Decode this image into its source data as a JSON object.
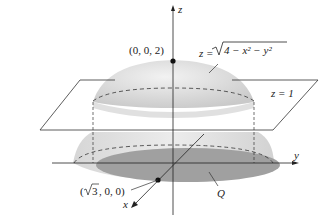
{
  "diagram": {
    "type": "3d-surface-figure",
    "axes": {
      "z": "z",
      "y": "y",
      "x": "x"
    },
    "labels": {
      "top_point": "(0, 0, 2)",
      "surface_eq_prefix": "z = ",
      "surface_eq_radicand": "4 − x² − y²",
      "plane_eq": "z = 1",
      "x_point_open": "(",
      "x_point_sqrt": "3",
      "x_point_rest": ", 0, 0)",
      "region": "Q"
    },
    "colors": {
      "hemisphere_light": "#e8e8e8",
      "hemisphere_mid": "#cfcfcf",
      "region_shadow": "#9a9a9a",
      "lines": "#222222"
    }
  }
}
